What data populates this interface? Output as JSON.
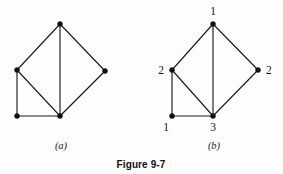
{
  "figure": {
    "title": "Figure 9-7",
    "background_color": "#fdfdfd",
    "ink_color": "#1c1c1c",
    "panels": [
      {
        "id": "a",
        "caption": "(a)",
        "caption_x": 61,
        "caption_y": 149,
        "labeled": false,
        "vertices": [
          {
            "id": "a-top",
            "label": "",
            "x": 60,
            "y": 24,
            "label_x": 60,
            "label_y": 16,
            "label_anchor": "middle"
          },
          {
            "id": "a-left",
            "label": "",
            "x": 17,
            "y": 70,
            "label_x": 9,
            "label_y": 74,
            "label_anchor": "end"
          },
          {
            "id": "a-right",
            "label": "",
            "x": 105,
            "y": 71,
            "label_x": 113,
            "label_y": 75,
            "label_anchor": "start"
          },
          {
            "id": "a-bleft",
            "label": "",
            "x": 17,
            "y": 116,
            "label_x": 11,
            "label_y": 131,
            "label_anchor": "middle"
          },
          {
            "id": "a-bmid",
            "label": "",
            "x": 60,
            "y": 116,
            "label_x": 60,
            "label_y": 131,
            "label_anchor": "middle"
          }
        ],
        "edges": [
          {
            "from": "a-top",
            "to": "a-left"
          },
          {
            "from": "a-top",
            "to": "a-right"
          },
          {
            "from": "a-top",
            "to": "a-bmid"
          },
          {
            "from": "a-left",
            "to": "a-bleft"
          },
          {
            "from": "a-left",
            "to": "a-bmid"
          },
          {
            "from": "a-right",
            "to": "a-bmid"
          },
          {
            "from": "a-bleft",
            "to": "a-bmid"
          }
        ]
      },
      {
        "id": "b",
        "caption": "(b)",
        "caption_x": 214,
        "caption_y": 149,
        "labeled": true,
        "vertices": [
          {
            "id": "b-top",
            "label": "1",
            "x": 213,
            "y": 24,
            "label_x": 213,
            "label_y": 15,
            "label_anchor": "middle"
          },
          {
            "id": "b-left",
            "label": "2",
            "x": 172,
            "y": 70,
            "label_x": 164,
            "label_y": 74,
            "label_anchor": "end"
          },
          {
            "id": "b-right",
            "label": "2",
            "x": 258,
            "y": 70,
            "label_x": 266,
            "label_y": 74,
            "label_anchor": "start"
          },
          {
            "id": "b-bleft",
            "label": "1",
            "x": 172,
            "y": 116,
            "label_x": 166,
            "label_y": 131,
            "label_anchor": "middle"
          },
          {
            "id": "b-bmid",
            "label": "3",
            "x": 213,
            "y": 116,
            "label_x": 213,
            "label_y": 131,
            "label_anchor": "middle"
          }
        ],
        "edges": [
          {
            "from": "b-top",
            "to": "b-left"
          },
          {
            "from": "b-top",
            "to": "b-right"
          },
          {
            "from": "b-top",
            "to": "b-bmid"
          },
          {
            "from": "b-left",
            "to": "b-bleft"
          },
          {
            "from": "b-left",
            "to": "b-bmid"
          },
          {
            "from": "b-right",
            "to": "b-bmid"
          },
          {
            "from": "b-bleft",
            "to": "b-bmid"
          }
        ]
      }
    ],
    "title_x": 141,
    "title_y": 168
  }
}
